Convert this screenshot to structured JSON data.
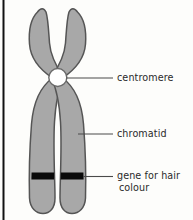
{
  "figure": {
    "background_color": "#fdfdfb",
    "border_color": "#111111",
    "width": 193,
    "height": 220
  },
  "chromosome": {
    "fill_color": "#a8a8a8",
    "outline_color": "#555555",
    "band_color": "#0a0a0a",
    "centromere_fill": "#ffffff"
  },
  "labels": {
    "centromere": "centromere",
    "chromatid": "chromatid",
    "gene_line1": "gene for hair",
    "gene_line2": "colour"
  },
  "leader_lines": {
    "color": "#4a4a4a"
  }
}
